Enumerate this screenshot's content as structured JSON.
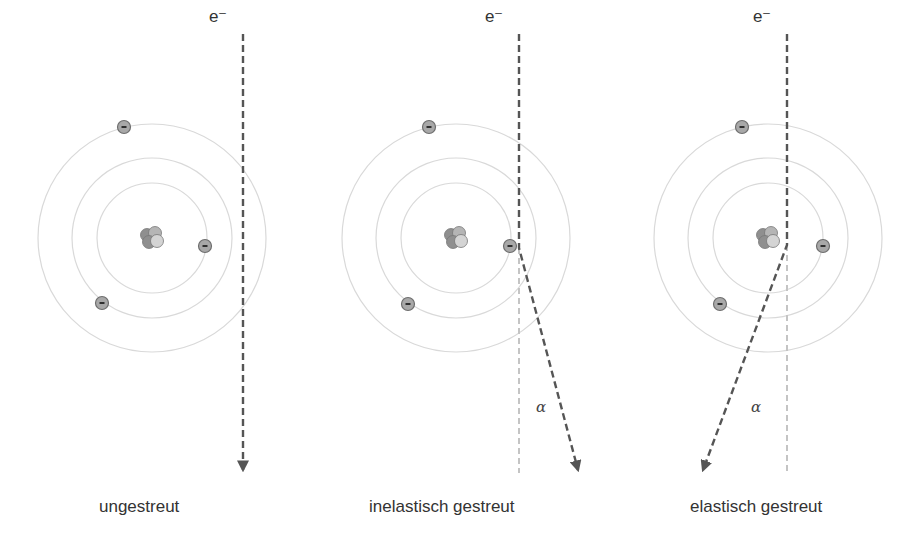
{
  "colors": {
    "orbit": "#d9d9d9",
    "path": "#555555",
    "ghost_path": "#c4c4c4",
    "electron_fill": "#a8a8a8",
    "electron_stroke": "#6e6e6e",
    "nucleus_dark": "#8f8f8f",
    "nucleus_light": "#d4d4d4"
  },
  "panels": [
    {
      "id": "unscattered",
      "caption": "ungestreut",
      "electron_symbol": "e⁻",
      "alpha_label": "",
      "center": [
        152,
        238
      ],
      "orbits": [
        55,
        80,
        114
      ],
      "electrons": [
        [
          124,
          127
        ],
        [
          205,
          246
        ],
        [
          102,
          303
        ]
      ],
      "path": {
        "x": 243,
        "y_start": 34,
        "deflect_at": null,
        "end": [
          243,
          470
        ]
      },
      "ghost": null
    },
    {
      "id": "inelastic",
      "caption": "inelastisch gestreut",
      "electron_symbol": "e⁻",
      "alpha_label": "α",
      "center": [
        456,
        238
      ],
      "orbits": [
        55,
        80,
        114
      ],
      "electrons": [
        [
          429,
          127
        ],
        [
          510,
          246
        ],
        [
          408,
          304
        ]
      ],
      "path": {
        "x": 519,
        "y_start": 34,
        "deflect_at": 248,
        "end": [
          578,
          470
        ]
      },
      "ghost": {
        "x": 519,
        "y_start": 248,
        "y_end": 473
      }
    },
    {
      "id": "elastic",
      "caption": "elastisch gestreut",
      "electron_symbol": "e⁻",
      "alpha_label": "α",
      "center": [
        768,
        238
      ],
      "orbits": [
        55,
        80,
        114
      ],
      "electrons": [
        [
          742,
          127
        ],
        [
          823,
          246
        ],
        [
          720,
          304
        ]
      ],
      "path": {
        "x": 787,
        "y_start": 34,
        "deflect_at": 245,
        "end": [
          703,
          470
        ]
      },
      "ghost": {
        "x": 787,
        "y_start": 245,
        "y_end": 473
      }
    }
  ]
}
